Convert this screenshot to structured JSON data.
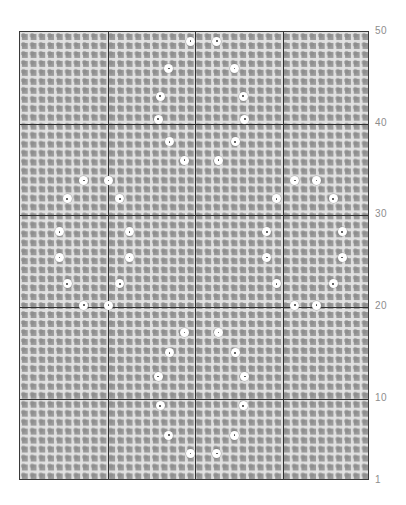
{
  "chart_data": {
    "type": "scatter",
    "title": "",
    "subtitle": "",
    "xlabel": "",
    "ylabel": "",
    "grid": true,
    "legend": null,
    "background": "dense square mesh / matrix grid",
    "colors": {
      "marker_fill": "#ffffff",
      "marker_center": "#4a4a4a",
      "grid_cell": "#9a9a9a",
      "grid_line": "#e2e2e2",
      "major_line": "#2f2f2f",
      "tick_label": "#8d8d8d",
      "frame": "#3a3a3a"
    },
    "ylim": [
      1,
      50
    ],
    "xlim": [
      0,
      40
    ],
    "ytick_labels": [
      "50",
      "40",
      "30",
      "20",
      "10",
      "1"
    ],
    "ytick_values": [
      50,
      40,
      30,
      20,
      10,
      1
    ],
    "xtick_labels": [],
    "major_x_positions": [
      10,
      20,
      30
    ],
    "major_y_positions": [
      10,
      20,
      30,
      40
    ],
    "n_cols": 40,
    "n_rows": 50,
    "points": [
      {
        "x": 19.5,
        "y": 49.0
      },
      {
        "x": 22.5,
        "y": 49.0
      },
      {
        "x": 17.0,
        "y": 46.0
      },
      {
        "x": 24.5,
        "y": 46.0
      },
      {
        "x": 16.0,
        "y": 43.0
      },
      {
        "x": 25.5,
        "y": 43.0
      },
      {
        "x": 15.8,
        "y": 40.5
      },
      {
        "x": 25.7,
        "y": 40.5
      },
      {
        "x": 17.1,
        "y": 38.0
      },
      {
        "x": 24.6,
        "y": 38.0
      },
      {
        "x": 18.8,
        "y": 36.0
      },
      {
        "x": 22.7,
        "y": 36.0
      },
      {
        "x": 7.3,
        "y": 33.8
      },
      {
        "x": 10.1,
        "y": 33.8
      },
      {
        "x": 31.4,
        "y": 33.8
      },
      {
        "x": 33.9,
        "y": 33.8
      },
      {
        "x": 5.4,
        "y": 31.8
      },
      {
        "x": 11.4,
        "y": 31.8
      },
      {
        "x": 29.3,
        "y": 31.8
      },
      {
        "x": 35.8,
        "y": 31.8
      },
      {
        "x": 4.5,
        "y": 28.2
      },
      {
        "x": 12.5,
        "y": 28.2
      },
      {
        "x": 28.2,
        "y": 28.2
      },
      {
        "x": 36.8,
        "y": 28.2
      },
      {
        "x": 4.5,
        "y": 25.4
      },
      {
        "x": 12.5,
        "y": 25.4
      },
      {
        "x": 28.2,
        "y": 25.4
      },
      {
        "x": 36.8,
        "y": 25.4
      },
      {
        "x": 5.4,
        "y": 22.5
      },
      {
        "x": 11.4,
        "y": 22.5
      },
      {
        "x": 29.3,
        "y": 22.5
      },
      {
        "x": 35.8,
        "y": 22.5
      },
      {
        "x": 7.3,
        "y": 20.2
      },
      {
        "x": 10.1,
        "y": 20.2
      },
      {
        "x": 31.4,
        "y": 20.2
      },
      {
        "x": 33.9,
        "y": 20.2
      },
      {
        "x": 18.8,
        "y": 17.2
      },
      {
        "x": 22.7,
        "y": 17.2
      },
      {
        "x": 17.1,
        "y": 15.0
      },
      {
        "x": 24.6,
        "y": 15.0
      },
      {
        "x": 15.8,
        "y": 12.4
      },
      {
        "x": 25.7,
        "y": 12.4
      },
      {
        "x": 16.0,
        "y": 9.2
      },
      {
        "x": 25.5,
        "y": 9.2
      },
      {
        "x": 17.0,
        "y": 6.0
      },
      {
        "x": 24.5,
        "y": 6.0
      },
      {
        "x": 19.5,
        "y": 4.0
      },
      {
        "x": 22.5,
        "y": 4.0
      }
    ]
  },
  "axis": {
    "y_ticks": [
      {
        "label": "50",
        "value": 50
      },
      {
        "label": "40",
        "value": 40
      },
      {
        "label": "30",
        "value": 30
      },
      {
        "label": "20",
        "value": 20
      },
      {
        "label": "10",
        "value": 10
      },
      {
        "label": "1",
        "value": 1
      }
    ]
  }
}
